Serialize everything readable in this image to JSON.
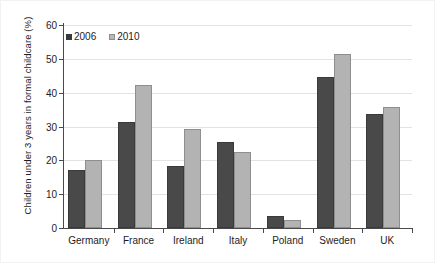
{
  "chart_data": {
    "type": "bar",
    "title": "",
    "xlabel": "",
    "ylabel": "Children under 3 years in formal childcare (%)",
    "ylim": [
      0,
      60
    ],
    "yticks": [
      0,
      10,
      20,
      30,
      40,
      50,
      60
    ],
    "grid": true,
    "legend_position": "top-left",
    "categories": [
      "Germany",
      "France",
      "Ireland",
      "Italy",
      "Poland",
      "Sweden",
      "UK"
    ],
    "series": [
      {
        "name": "2006",
        "color": "#494949",
        "values": [
          17,
          31.3,
          18.3,
          25.5,
          3.5,
          44.5,
          33.8
        ]
      },
      {
        "name": "2010",
        "color": "#b3b3b3",
        "values": [
          20,
          42.2,
          29.3,
          22.5,
          2.5,
          51.5,
          35.7
        ]
      }
    ]
  },
  "legend": {
    "items": [
      {
        "label": "2006"
      },
      {
        "label": "2010"
      }
    ]
  },
  "axis": {
    "y_tick_labels": [
      "0",
      "10",
      "20",
      "30",
      "40",
      "50",
      "60"
    ],
    "y_title": "Children under 3 years in formal childcare (%)"
  }
}
